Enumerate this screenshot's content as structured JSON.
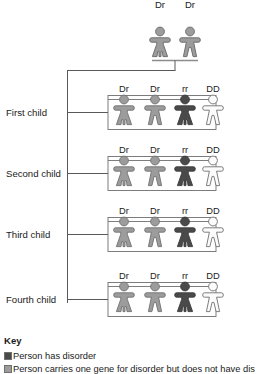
{
  "diagram": {
    "type": "pedigree-inheritance-chart",
    "parents": {
      "row_label": "",
      "individuals": [
        {
          "genotype": "Dr",
          "sex": "female",
          "status": "carrier",
          "fill": "#9c9c9c"
        },
        {
          "genotype": "Dr",
          "sex": "male",
          "status": "carrier",
          "fill": "#9c9c9c"
        }
      ]
    },
    "children_rows": [
      {
        "label": "First child",
        "individuals": [
          {
            "genotype": "Dr",
            "sex": "female",
            "status": "carrier",
            "fill": "#9c9c9c"
          },
          {
            "genotype": "Dr",
            "sex": "male",
            "status": "carrier",
            "fill": "#9c9c9c"
          },
          {
            "genotype": "rr",
            "sex": "female",
            "status": "affected",
            "fill": "#4a4a4a"
          },
          {
            "genotype": "DD",
            "sex": "male",
            "status": "unaffected",
            "fill": "#fbfbfb"
          }
        ]
      },
      {
        "label": "Second child",
        "individuals": [
          {
            "genotype": "Dr",
            "sex": "female",
            "status": "carrier",
            "fill": "#9c9c9c"
          },
          {
            "genotype": "Dr",
            "sex": "male",
            "status": "carrier",
            "fill": "#9c9c9c"
          },
          {
            "genotype": "rr",
            "sex": "female",
            "status": "affected",
            "fill": "#4a4a4a"
          },
          {
            "genotype": "DD",
            "sex": "male",
            "status": "unaffected",
            "fill": "#fbfbfb"
          }
        ]
      },
      {
        "label": "Third child",
        "individuals": [
          {
            "genotype": "Dr",
            "sex": "female",
            "status": "carrier",
            "fill": "#9c9c9c"
          },
          {
            "genotype": "Dr",
            "sex": "male",
            "status": "carrier",
            "fill": "#9c9c9c"
          },
          {
            "genotype": "rr",
            "sex": "female",
            "status": "affected",
            "fill": "#4a4a4a"
          },
          {
            "genotype": "DD",
            "sex": "male",
            "status": "unaffected",
            "fill": "#fbfbfb"
          }
        ]
      },
      {
        "label": "Fourth child",
        "individuals": [
          {
            "genotype": "Dr",
            "sex": "female",
            "status": "carrier",
            "fill": "#9c9c9c"
          },
          {
            "genotype": "Dr",
            "sex": "male",
            "status": "carrier",
            "fill": "#9c9c9c"
          },
          {
            "genotype": "rr",
            "sex": "female",
            "status": "affected",
            "fill": "#4a4a4a"
          },
          {
            "genotype": "DD",
            "sex": "male",
            "status": "unaffected",
            "fill": "#fbfbfb"
          }
        ]
      }
    ]
  },
  "key": {
    "title": "Key",
    "entries": [
      {
        "swatch": "#4a4a4a",
        "label": "Person has disorder"
      },
      {
        "swatch": "#9c9c9c",
        "label": "Person carries one gene for disorder but does not have dis"
      }
    ]
  },
  "colors": {
    "affected": "#4a4a4a",
    "carrier": "#9c9c9c",
    "unaffected": "#fbfbfb",
    "outline": "#6f6f6f",
    "line": "#595959",
    "text": "#1a1a1a"
  }
}
